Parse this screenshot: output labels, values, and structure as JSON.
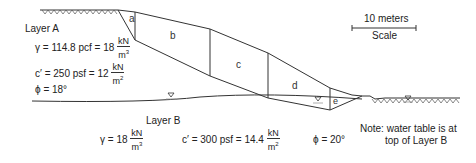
{
  "layer_a": {
    "title": "Layer A",
    "gamma": "γ = 114.8 pcf = 18",
    "gamma_unit_num": "kN",
    "gamma_unit_den": "m",
    "gamma_unit_exp": "3",
    "cohesion": "c′ = 250 psf = 12",
    "cohesion_unit_num": "kN",
    "cohesion_unit_den": "m",
    "cohesion_unit_exp": "2",
    "phi": "ϕ = 18°"
  },
  "layer_b": {
    "title": "Layer B",
    "gamma": "γ = 18",
    "gamma_unit_num": "kN",
    "gamma_unit_den": "m",
    "gamma_unit_exp": "3",
    "cohesion": "c′ = 300 psf = 14.4",
    "cohesion_unit_num": "kN",
    "cohesion_unit_den": "m",
    "cohesion_unit_exp": "2",
    "phi": "ϕ = 20°"
  },
  "slices": [
    "a",
    "b",
    "c",
    "d",
    "e"
  ],
  "scale": {
    "length": "10 meters",
    "label": "Scale"
  },
  "note": {
    "line1": "Note: water table is at",
    "line2": "top of Layer B"
  },
  "colors": {
    "line": "#333333",
    "water": "#999999"
  }
}
